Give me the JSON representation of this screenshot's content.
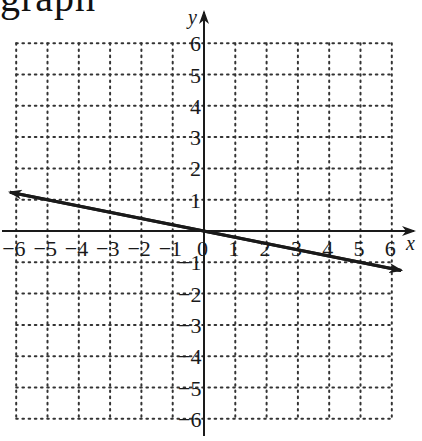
{
  "cropped_heading": "graph",
  "chart_data": {
    "type": "line",
    "title": "",
    "xlabel": "x",
    "ylabel": "y",
    "xlim": [
      -6,
      6
    ],
    "ylim": [
      -6,
      6
    ],
    "grid": true,
    "grid_style": "dotted",
    "x_ticks": [
      -6,
      -5,
      -4,
      -3,
      -2,
      -1,
      0,
      1,
      2,
      3,
      4,
      5,
      6
    ],
    "y_ticks": [
      -6,
      -5,
      -4,
      -3,
      -2,
      -1,
      1,
      2,
      3,
      4,
      5,
      6
    ],
    "x_tick_labels": [
      "−6",
      "−5",
      "−4",
      "−3",
      "−2",
      "−1",
      "0",
      "1",
      "2",
      "3",
      "4",
      "5",
      "6"
    ],
    "y_tick_labels": [
      "−6",
      "−5",
      "−4",
      "−3",
      "−2",
      "−1",
      "1",
      "2",
      "3",
      "4",
      "5",
      "6"
    ],
    "series": [
      {
        "name": "line",
        "equation": "y = -x/5",
        "slope": -0.2,
        "intercept": 0,
        "x": [
          -6.2,
          6.3
        ],
        "y": [
          1.24,
          -1.26
        ],
        "arrows": "both",
        "color": "#1a1a1a"
      }
    ],
    "legend": null
  },
  "colors": {
    "ink": "#1a1a1a",
    "grid": "#333333",
    "background": "#ffffff"
  }
}
